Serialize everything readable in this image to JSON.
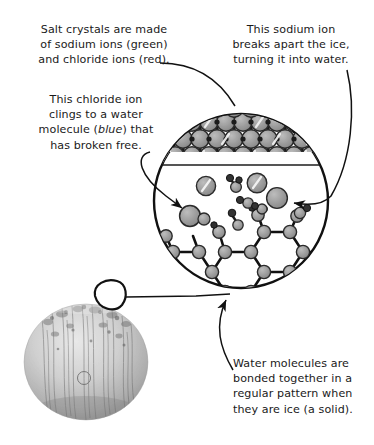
{
  "figure": {
    "background_color": "#ffffff",
    "ink_color": "#111111"
  },
  "captions": {
    "salt_crystals": {
      "text": "Salt crystals are made\nof sodium ions (green)\nand chloride ions (red).",
      "align": "center"
    },
    "chloride_ion": {
      "line1": "This chloride ion",
      "line2": "clings to a water",
      "line3_pre": "molecule (",
      "line3_em": "blue",
      "line3_post": ") that",
      "line4": "has broken free.",
      "align": "center"
    },
    "sodium_ion": {
      "text": "This sodium ion\nbreaks apart the ice,\nturning it into water.",
      "align": "center"
    },
    "water_molecules": {
      "text": "Water molecules are\nbonded together in a\nregular pattern when\nthey are ice (a solid).",
      "align": "left"
    }
  },
  "legend_colors": {
    "sodium_label": "green",
    "chloride_label": "red",
    "water_label": "blue",
    "sphere_fill": "#9d9d9d",
    "sphere_stroke": "#2b2b2b",
    "bond_color": "#1c1c1c",
    "small_atom_fill": "#3a3a3a"
  },
  "diagram": {
    "magnifier_circle": {
      "center_x": 241,
      "center_y": 201,
      "radius": 88,
      "stroke_width": 2.4
    },
    "regions": [
      {
        "name": "salt-crystal-lattice",
        "description": "Densely packed cubic array of sodium and chloride ions filling the top of the magnified circle",
        "rows": 3
      },
      {
        "name": "free-ions-zone",
        "description": "Loose ions and freed water molecules in the middle of the circle"
      },
      {
        "name": "ice-lattice",
        "description": "Hexagonal honeycomb network of bonded water molecules at the bottom of the circle"
      }
    ],
    "photo": {
      "name": "ice-ball-photograph",
      "description": "Grayscale photo of a rounded ice block with vertical streaks",
      "center_x": 86,
      "center_y": 362,
      "radius_x": 62,
      "radius_y": 58
    },
    "callout_marker": {
      "name": "magnified-spot-marker",
      "center_x": 110,
      "center_y": 296,
      "radius": 17
    }
  },
  "leaders": [
    {
      "name": "leader-salt-to-lattice",
      "from": "salt_crystals caption",
      "to": "salt-crystal-lattice"
    },
    {
      "name": "leader-chloride-to-ion",
      "from": "chloride_ion caption",
      "to": "chloride-water-pair"
    },
    {
      "name": "leader-sodium-to-ion",
      "from": "sodium_ion caption",
      "to": "free-sodium-ion"
    },
    {
      "name": "leader-water-to-lattice",
      "from": "water_molecules caption",
      "to": "ice-lattice"
    },
    {
      "name": "leader-photo-to-circle",
      "from": "magnified-spot-marker",
      "to": "magnifier_circle"
    }
  ]
}
